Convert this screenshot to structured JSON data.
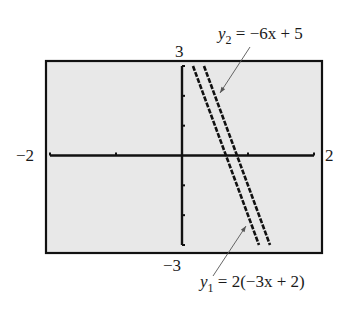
{
  "chart_data": {
    "type": "line",
    "title": "",
    "xlabel": "",
    "ylabel": "",
    "xlim": [
      -2,
      2
    ],
    "ylim": [
      -3,
      3
    ],
    "x_tick_labels": [
      "-2",
      "2"
    ],
    "y_tick_labels": [
      "3",
      "-3"
    ],
    "x_ticks": [
      -2,
      -1,
      0,
      1,
      2
    ],
    "y_ticks": [
      -3,
      -2,
      -1,
      0,
      1,
      2,
      3
    ],
    "grid": false,
    "style": "graphing-calculator screen",
    "series": [
      {
        "name": "y1 = 2(-3x + 2)",
        "equation": "y = -6x + 4",
        "slope": -6,
        "intercept": 4,
        "x": [
          0.1667,
          0.5,
          1.1667
        ],
        "y": [
          3,
          1,
          -3
        ]
      },
      {
        "name": "y2 = -6x + 5",
        "equation": "y = -6x + 5",
        "slope": -6,
        "intercept": 5,
        "x": [
          0.3333,
          0.8333,
          1.3333
        ],
        "y": [
          3,
          0,
          -3
        ]
      }
    ],
    "annotations": [
      {
        "text": "y2 = -6x + 5",
        "points_to": "y2"
      },
      {
        "text": "y1 = 2(-3x + 2)",
        "points_to": "y1"
      }
    ]
  },
  "labels": {
    "x_min": "−2",
    "x_max": "2",
    "y_max": "3",
    "y_min": "−3",
    "y2": {
      "var": "y",
      "sub": "2",
      "rest": " = −6x + 5"
    },
    "y1": {
      "var": "y",
      "sub": "1",
      "rest": " = 2(−3x + 2)"
    }
  },
  "colors": {
    "screen_bg": "#e8e8e8",
    "ink": "#111111",
    "arrow": "#555555"
  }
}
